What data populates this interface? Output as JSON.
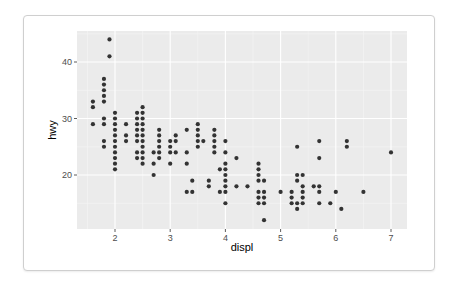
{
  "chart_data": {
    "type": "scatter",
    "title": "",
    "xlabel": "displ",
    "ylabel": "hwy",
    "xlim": [
      1.3,
      7.3
    ],
    "ylim": [
      10.4,
      45.6
    ],
    "x_ticks": [
      2,
      3,
      4,
      5,
      6,
      7
    ],
    "y_ticks": [
      20,
      30,
      40
    ],
    "grid": true,
    "legend": "none",
    "point_color": "#333333",
    "panel_background": "#ebebeb",
    "points": [
      [
        1.6,
        33
      ],
      [
        1.6,
        32
      ],
      [
        1.6,
        29
      ],
      [
        1.8,
        37
      ],
      [
        1.8,
        36
      ],
      [
        1.8,
        35
      ],
      [
        1.8,
        34
      ],
      [
        1.8,
        33
      ],
      [
        1.8,
        30
      ],
      [
        1.8,
        29
      ],
      [
        1.8,
        26
      ],
      [
        1.8,
        25
      ],
      [
        1.9,
        44
      ],
      [
        1.9,
        41
      ],
      [
        2.0,
        31
      ],
      [
        2.0,
        30
      ],
      [
        2.0,
        29
      ],
      [
        2.0,
        28
      ],
      [
        2.0,
        27
      ],
      [
        2.0,
        26
      ],
      [
        2.0,
        25
      ],
      [
        2.0,
        24
      ],
      [
        2.0,
        23
      ],
      [
        2.0,
        22
      ],
      [
        2.0,
        21
      ],
      [
        2.2,
        29
      ],
      [
        2.2,
        27
      ],
      [
        2.2,
        26
      ],
      [
        2.4,
        31
      ],
      [
        2.4,
        30
      ],
      [
        2.4,
        29
      ],
      [
        2.4,
        28
      ],
      [
        2.4,
        27
      ],
      [
        2.4,
        26
      ],
      [
        2.4,
        24
      ],
      [
        2.4,
        23
      ],
      [
        2.5,
        32
      ],
      [
        2.5,
        31
      ],
      [
        2.5,
        30
      ],
      [
        2.5,
        29
      ],
      [
        2.5,
        28
      ],
      [
        2.5,
        27
      ],
      [
        2.5,
        26
      ],
      [
        2.5,
        25
      ],
      [
        2.5,
        24
      ],
      [
        2.5,
        23
      ],
      [
        2.5,
        22
      ],
      [
        2.7,
        24
      ],
      [
        2.7,
        22
      ],
      [
        2.7,
        20
      ],
      [
        2.8,
        28
      ],
      [
        2.8,
        27
      ],
      [
        2.8,
        26
      ],
      [
        2.8,
        25
      ],
      [
        2.8,
        24
      ],
      [
        2.8,
        23
      ],
      [
        3.0,
        26
      ],
      [
        3.0,
        25
      ],
      [
        3.0,
        24
      ],
      [
        3.0,
        22
      ],
      [
        3.1,
        27
      ],
      [
        3.1,
        26
      ],
      [
        3.1,
        24
      ],
      [
        3.3,
        28
      ],
      [
        3.3,
        24
      ],
      [
        3.3,
        22
      ],
      [
        3.3,
        17
      ],
      [
        3.4,
        19
      ],
      [
        3.4,
        17
      ],
      [
        3.5,
        29
      ],
      [
        3.5,
        28
      ],
      [
        3.5,
        27
      ],
      [
        3.5,
        26
      ],
      [
        3.5,
        25
      ],
      [
        3.6,
        26
      ],
      [
        3.7,
        19
      ],
      [
        3.7,
        18
      ],
      [
        3.8,
        28
      ],
      [
        3.8,
        27
      ],
      [
        3.8,
        26
      ],
      [
        3.8,
        25
      ],
      [
        3.8,
        24
      ],
      [
        3.9,
        21
      ],
      [
        3.9,
        17
      ],
      [
        4.0,
        26
      ],
      [
        4.0,
        24
      ],
      [
        4.0,
        22
      ],
      [
        4.0,
        21
      ],
      [
        4.0,
        20
      ],
      [
        4.0,
        19
      ],
      [
        4.0,
        18
      ],
      [
        4.0,
        17
      ],
      [
        4.0,
        15
      ],
      [
        4.2,
        23
      ],
      [
        4.2,
        18
      ],
      [
        4.4,
        18
      ],
      [
        4.6,
        22
      ],
      [
        4.6,
        21
      ],
      [
        4.6,
        20
      ],
      [
        4.6,
        19
      ],
      [
        4.6,
        17
      ],
      [
        4.6,
        16
      ],
      [
        4.6,
        15
      ],
      [
        4.7,
        19
      ],
      [
        4.7,
        17
      ],
      [
        4.7,
        16
      ],
      [
        4.7,
        15
      ],
      [
        4.7,
        12
      ],
      [
        5.0,
        17
      ],
      [
        5.2,
        17
      ],
      [
        5.2,
        16
      ],
      [
        5.2,
        15
      ],
      [
        5.3,
        25
      ],
      [
        5.3,
        20
      ],
      [
        5.3,
        19
      ],
      [
        5.3,
        15
      ],
      [
        5.3,
        14
      ],
      [
        5.4,
        20
      ],
      [
        5.4,
        18
      ],
      [
        5.4,
        17
      ],
      [
        5.4,
        16
      ],
      [
        5.4,
        15
      ],
      [
        5.6,
        18
      ],
      [
        5.7,
        26
      ],
      [
        5.7,
        23
      ],
      [
        5.7,
        18
      ],
      [
        5.7,
        17
      ],
      [
        5.7,
        15
      ],
      [
        5.9,
        15
      ],
      [
        6.0,
        17
      ],
      [
        6.1,
        14
      ],
      [
        6.2,
        26
      ],
      [
        6.2,
        25
      ],
      [
        6.5,
        17
      ],
      [
        7.0,
        24
      ]
    ]
  }
}
